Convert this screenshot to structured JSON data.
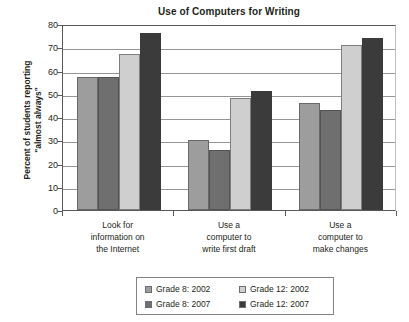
{
  "chart_data": {
    "type": "bar",
    "title": "Use of Computers for Writing",
    "xlabel": "",
    "ylabel": "Percent of students reporting \"almost always\"",
    "ylabel_line1": "Percent of students reporting",
    "ylabel_line2": "\"almost always\"",
    "ylim": [
      0,
      80
    ],
    "ytick_step": 10,
    "yticks": [
      "80",
      "70",
      "60",
      "50",
      "40",
      "30",
      "20",
      "10",
      "0"
    ],
    "ytick_values": [
      80,
      70,
      60,
      50,
      40,
      30,
      20,
      10,
      0
    ],
    "grid": "horizontal",
    "legend_position": "bottom",
    "categories": [
      "Look for information on the Internet",
      "Use a computer to write first draft",
      "Use a computer to make changes"
    ],
    "category_lines": [
      [
        "Look for",
        "information on",
        "the Internet"
      ],
      [
        "Use a",
        "computer to",
        "write first draft"
      ],
      [
        "Use a",
        "computer to",
        "make changes"
      ]
    ],
    "series": [
      {
        "name": "Grade 8: 2002",
        "color": "#9d9d9d",
        "values": [
          57,
          30,
          46
        ]
      },
      {
        "name": "Grade 8: 2007",
        "color": "#6f6f6f",
        "values": [
          57,
          26,
          43
        ]
      },
      {
        "name": "Grade 12: 2002",
        "color": "#cfcfcf",
        "values": [
          67,
          48,
          71
        ]
      },
      {
        "name": "Grade 12: 2007",
        "color": "#3b3b3b",
        "values": [
          76,
          51,
          74
        ]
      }
    ]
  },
  "legend": {
    "entries": [
      {
        "label": "Grade 8: 2002",
        "color": "#9d9d9d"
      },
      {
        "label": "Grade 12: 2002",
        "color": "#cfcfcf"
      },
      {
        "label": "Grade 8: 2007",
        "color": "#6f6f6f"
      },
      {
        "label": "Grade 12: 2007",
        "color": "#3b3b3b"
      }
    ]
  }
}
